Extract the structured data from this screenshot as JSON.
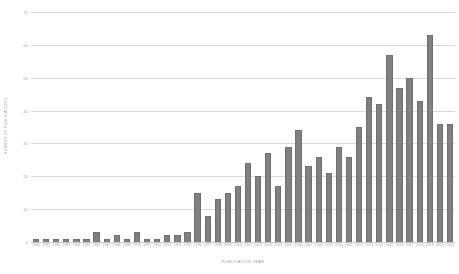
{
  "chart_data": {
    "type": "bar",
    "title": "",
    "xlabel": "PUBLICATION YEAR",
    "ylabel": "NUMBER OF PUBLICATIONS",
    "ylim": [
      0,
      70
    ],
    "yticks": [
      0,
      10,
      20,
      30,
      40,
      50,
      60,
      70
    ],
    "grid": true,
    "legend": false,
    "bar_color": "#808080",
    "grid_color": "#d9d9d9",
    "categories": [
      "1980",
      "1981",
      "1982",
      "1983",
      "1984",
      "1985",
      "1986",
      "1987",
      "1988",
      "1989",
      "1990",
      "1991",
      "1992",
      "1993",
      "1994",
      "1995",
      "1996",
      "1997",
      "1998",
      "1999",
      "2000",
      "2001",
      "2002",
      "2003",
      "2004",
      "2005",
      "2006",
      "2007",
      "2008",
      "2009",
      "2010",
      "2011",
      "2012",
      "2013",
      "2014",
      "2015",
      "2016",
      "2017",
      "2018",
      "2019",
      "2020",
      "2021"
    ],
    "values": [
      1,
      1,
      1,
      1,
      1,
      1,
      3,
      1,
      2,
      1,
      3,
      1,
      1,
      2,
      2,
      3,
      15,
      8,
      13,
      15,
      17,
      24,
      20,
      27,
      17,
      29,
      34,
      23,
      26,
      21,
      29,
      26,
      35,
      44,
      42,
      57,
      47,
      50,
      43,
      63,
      36,
      36
    ]
  }
}
